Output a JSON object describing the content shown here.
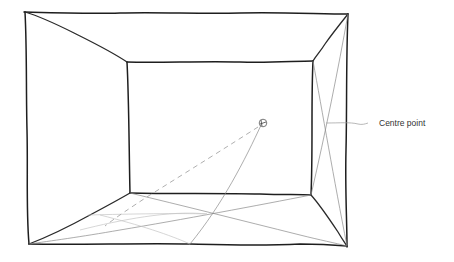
{
  "diagram": {
    "type": "one-point perspective room sketch",
    "annotations": [
      {
        "id": "centre-point",
        "label": "Centre point"
      }
    ],
    "colors": {
      "ink": "#1e1e1e",
      "guide_line": "#8a8a8a",
      "faint_line": "#c4c4c4",
      "label_text": "#333333",
      "background": "#ffffff"
    }
  }
}
